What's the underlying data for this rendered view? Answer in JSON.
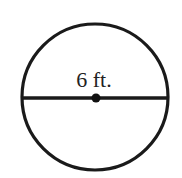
{
  "diagram": {
    "type": "circle-with-diameter",
    "label": "6 ft.",
    "measurement": {
      "value": 6,
      "unit": "ft.",
      "represents": "diameter"
    },
    "colors": {
      "stroke": "#1a1a1a",
      "background": "#ffffff",
      "text": "#222222"
    }
  }
}
